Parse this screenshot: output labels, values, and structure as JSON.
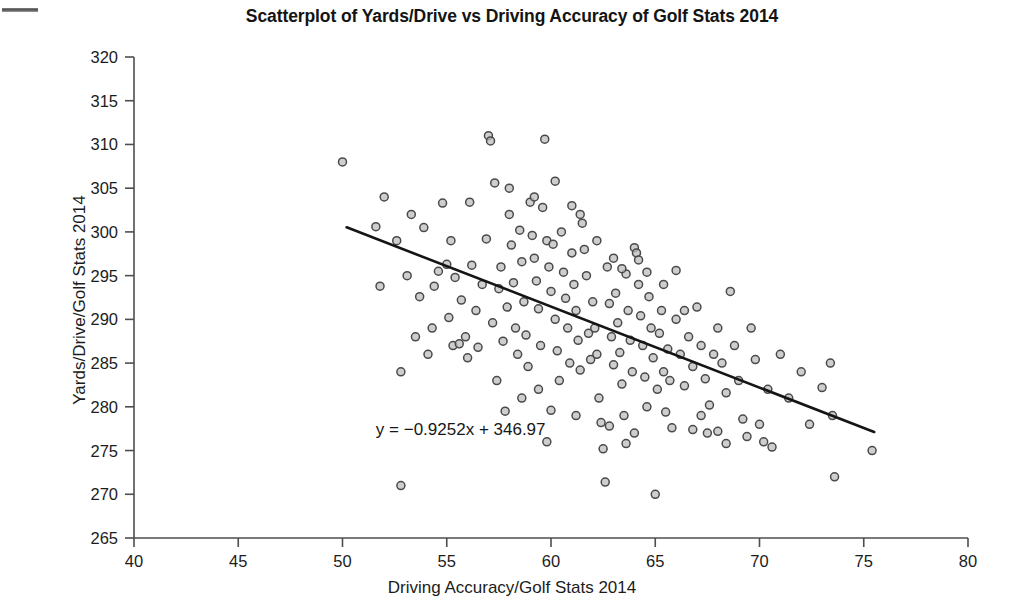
{
  "figure": {
    "title": "Scatterplot of Yards/Drive vs Driving Accuracy of Golf Stats 2014",
    "annotation": "y = −0.9252x + 346.97",
    "scan_artifact": "scan-edge-mark"
  },
  "chart_data": {
    "type": "scatter",
    "title": "Scatterplot of Yards/Drive vs Driving Accuracy of Golf Stats 2014",
    "xlabel": "Driving Accuracy/Golf Stats 2014",
    "ylabel": "Yards/Drive/Golf Stats 2014",
    "xlim": [
      40,
      80
    ],
    "ylim": [
      265,
      320
    ],
    "xticks": [
      40,
      45,
      50,
      55,
      60,
      65,
      70,
      75,
      80
    ],
    "yticks": [
      265,
      270,
      275,
      280,
      285,
      290,
      295,
      300,
      305,
      310,
      315,
      320
    ],
    "xtick_labels": [
      "40",
      "45",
      "50",
      "55",
      "60",
      "65",
      "70",
      "75",
      "80"
    ],
    "ytick_labels": [
      "265",
      "270",
      "275",
      "280",
      "285",
      "290",
      "295",
      "300",
      "305",
      "310",
      "315",
      "320"
    ],
    "grid": false,
    "legend": null,
    "marker": {
      "shape": "circle",
      "size_px": 8,
      "fill": "#bdbdbd",
      "edge": "#4a4a4a"
    },
    "trendline": {
      "equation": "y = −0.9252x + 346.97",
      "slope": -0.9252,
      "intercept": 346.97,
      "color": "#151515",
      "x_start": 50.2,
      "x_end": 75.5,
      "label_x": 51.6,
      "label_y": 277.2
    },
    "n_points": 180,
    "points": [
      [
        50.0,
        308.0
      ],
      [
        51.6,
        300.6
      ],
      [
        51.8,
        293.8
      ],
      [
        52.0,
        304.0
      ],
      [
        52.6,
        299.0
      ],
      [
        52.8,
        284.0
      ],
      [
        52.8,
        271.0
      ],
      [
        53.3,
        302.0
      ],
      [
        53.5,
        288.0
      ],
      [
        53.7,
        292.6
      ],
      [
        53.9,
        300.5
      ],
      [
        54.1,
        286.0
      ],
      [
        54.3,
        289.0
      ],
      [
        54.6,
        295.5
      ],
      [
        54.8,
        303.3
      ],
      [
        55.0,
        296.3
      ],
      [
        55.1,
        290.2
      ],
      [
        55.3,
        287.0
      ],
      [
        55.4,
        294.8
      ],
      [
        55.6,
        287.2
      ],
      [
        55.7,
        292.2
      ],
      [
        55.9,
        288.0
      ],
      [
        56.0,
        285.6
      ],
      [
        56.2,
        296.2
      ],
      [
        56.4,
        291.0
      ],
      [
        56.5,
        286.8
      ],
      [
        56.7,
        294.0
      ],
      [
        56.9,
        299.2
      ],
      [
        57.0,
        311.0
      ],
      [
        57.1,
        310.4
      ],
      [
        57.2,
        289.6
      ],
      [
        57.4,
        283.0
      ],
      [
        57.5,
        293.5
      ],
      [
        57.6,
        296.0
      ],
      [
        57.7,
        287.5
      ],
      [
        57.9,
        291.4
      ],
      [
        58.0,
        302.0
      ],
      [
        58.1,
        298.5
      ],
      [
        58.2,
        294.2
      ],
      [
        58.3,
        289.0
      ],
      [
        58.4,
        286.0
      ],
      [
        58.5,
        300.2
      ],
      [
        58.6,
        296.6
      ],
      [
        58.7,
        292.0
      ],
      [
        58.8,
        288.2
      ],
      [
        58.9,
        284.6
      ],
      [
        59.0,
        303.4
      ],
      [
        59.1,
        299.6
      ],
      [
        59.2,
        297.0
      ],
      [
        59.3,
        294.4
      ],
      [
        59.4,
        291.2
      ],
      [
        59.5,
        287.0
      ],
      [
        59.6,
        302.8
      ],
      [
        59.7,
        310.6
      ],
      [
        59.8,
        299.0
      ],
      [
        59.9,
        296.0
      ],
      [
        60.0,
        293.2
      ],
      [
        60.1,
        298.6
      ],
      [
        60.2,
        290.0
      ],
      [
        60.3,
        286.4
      ],
      [
        60.4,
        283.0
      ],
      [
        60.5,
        300.0
      ],
      [
        60.6,
        295.4
      ],
      [
        60.7,
        292.4
      ],
      [
        60.8,
        289.0
      ],
      [
        60.9,
        285.0
      ],
      [
        61.0,
        297.6
      ],
      [
        61.1,
        294.0
      ],
      [
        61.2,
        291.0
      ],
      [
        61.3,
        287.6
      ],
      [
        61.4,
        284.2
      ],
      [
        61.5,
        301.0
      ],
      [
        61.6,
        298.0
      ],
      [
        61.7,
        295.0
      ],
      [
        61.8,
        288.4
      ],
      [
        61.9,
        285.4
      ],
      [
        62.0,
        292.0
      ],
      [
        62.1,
        289.0
      ],
      [
        62.2,
        286.0
      ],
      [
        62.3,
        281.0
      ],
      [
        62.4,
        278.2
      ],
      [
        62.5,
        275.2
      ],
      [
        62.6,
        271.4
      ],
      [
        62.7,
        296.0
      ],
      [
        62.8,
        291.8
      ],
      [
        62.9,
        288.0
      ],
      [
        63.0,
        284.8
      ],
      [
        63.1,
        293.0
      ],
      [
        63.2,
        289.6
      ],
      [
        63.3,
        286.2
      ],
      [
        63.4,
        282.6
      ],
      [
        63.5,
        279.0
      ],
      [
        63.6,
        295.2
      ],
      [
        63.7,
        291.0
      ],
      [
        63.8,
        287.6
      ],
      [
        63.9,
        284.0
      ],
      [
        64.0,
        298.2
      ],
      [
        64.1,
        297.6
      ],
      [
        64.2,
        294.0
      ],
      [
        64.3,
        290.4
      ],
      [
        64.4,
        287.0
      ],
      [
        64.5,
        283.4
      ],
      [
        64.6,
        280.0
      ],
      [
        64.7,
        292.6
      ],
      [
        64.8,
        289.0
      ],
      [
        64.9,
        285.6
      ],
      [
        65.0,
        270.0
      ],
      [
        65.1,
        282.0
      ],
      [
        65.2,
        288.4
      ],
      [
        65.3,
        291.0
      ],
      [
        65.4,
        284.0
      ],
      [
        65.5,
        279.4
      ],
      [
        65.6,
        286.6
      ],
      [
        65.7,
        283.0
      ],
      [
        65.8,
        277.6
      ],
      [
        66.0,
        290.0
      ],
      [
        66.2,
        286.0
      ],
      [
        66.4,
        282.4
      ],
      [
        66.6,
        288.0
      ],
      [
        66.8,
        284.6
      ],
      [
        67.0,
        291.4
      ],
      [
        67.2,
        287.0
      ],
      [
        67.4,
        283.2
      ],
      [
        67.5,
        277.0
      ],
      [
        67.6,
        280.2
      ],
      [
        67.8,
        286.0
      ],
      [
        68.0,
        289.0
      ],
      [
        68.2,
        285.0
      ],
      [
        68.4,
        281.6
      ],
      [
        68.6,
        293.2
      ],
      [
        68.8,
        287.0
      ],
      [
        69.0,
        283.0
      ],
      [
        69.2,
        278.6
      ],
      [
        69.4,
        276.6
      ],
      [
        69.6,
        289.0
      ],
      [
        69.8,
        285.4
      ],
      [
        70.0,
        278.0
      ],
      [
        70.2,
        276.0
      ],
      [
        70.4,
        282.0
      ],
      [
        70.6,
        275.4
      ],
      [
        71.0,
        286.0
      ],
      [
        71.4,
        281.0
      ],
      [
        72.0,
        284.0
      ],
      [
        72.4,
        278.0
      ],
      [
        73.0,
        282.2
      ],
      [
        73.4,
        285.0
      ],
      [
        73.5,
        279.0
      ],
      [
        73.6,
        272.0
      ],
      [
        75.4,
        275.0
      ],
      [
        56.1,
        303.4
      ],
      [
        57.3,
        305.6
      ],
      [
        58.0,
        305.0
      ],
      [
        59.2,
        304.0
      ],
      [
        60.2,
        305.8
      ],
      [
        61.0,
        303.0
      ],
      [
        61.4,
        302.0
      ],
      [
        54.4,
        293.8
      ],
      [
        55.2,
        299.0
      ],
      [
        53.1,
        295.0
      ],
      [
        62.2,
        299.0
      ],
      [
        63.0,
        297.0
      ],
      [
        63.4,
        295.8
      ],
      [
        64.2,
        296.8
      ],
      [
        64.6,
        295.4
      ],
      [
        65.4,
        294.0
      ],
      [
        66.0,
        295.6
      ],
      [
        66.4,
        291.0
      ],
      [
        59.4,
        282.0
      ],
      [
        60.0,
        279.6
      ],
      [
        61.2,
        279.0
      ],
      [
        58.6,
        281.0
      ],
      [
        57.8,
        279.5
      ],
      [
        62.8,
        277.8
      ],
      [
        63.6,
        275.8
      ],
      [
        64.0,
        277.0
      ],
      [
        66.8,
        277.4
      ],
      [
        67.2,
        279.0
      ],
      [
        68.0,
        277.2
      ],
      [
        59.8,
        276.0
      ],
      [
        68.4,
        275.8
      ]
    ]
  }
}
